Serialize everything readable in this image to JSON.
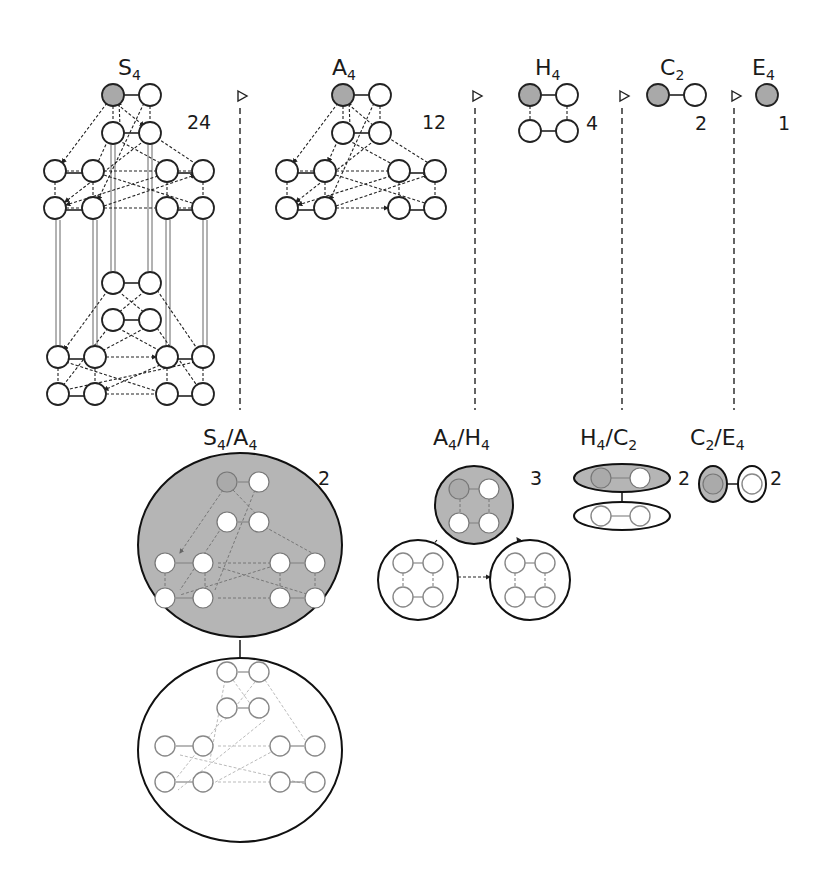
{
  "figure": {
    "type": "Cayley graphs of the composition series of S4 and their quotient groups",
    "top_row": [
      {
        "id": "S4",
        "label_base": "S",
        "label_sub": "4",
        "order": "24"
      },
      {
        "id": "A4",
        "label_base": "A",
        "label_sub": "4",
        "order": "12"
      },
      {
        "id": "H4",
        "label_base": "H",
        "label_sub": "4",
        "order": "4"
      },
      {
        "id": "C2",
        "label_base": "C",
        "label_sub": "2",
        "order": "2"
      },
      {
        "id": "E4",
        "label_base": "E",
        "label_sub": "4",
        "order": "1"
      }
    ],
    "subgroup_marker": "normal-subgroup-triangle-icon",
    "quotients": [
      {
        "id": "S4/A4",
        "num_base": "S",
        "num_sub": "4",
        "den_base": "A",
        "den_sub": "4",
        "order": "2"
      },
      {
        "id": "A4/H4",
        "num_base": "A",
        "num_sub": "4",
        "den_base": "H",
        "den_sub": "4",
        "order": "3"
      },
      {
        "id": "H4/C2",
        "num_base": "H",
        "num_sub": "4",
        "den_base": "C",
        "den_sub": "2",
        "order": "2"
      },
      {
        "id": "C2/E4",
        "num_base": "C",
        "num_sub": "2",
        "den_base": "E",
        "den_sub": "4",
        "order": "2"
      }
    ],
    "slash": "/",
    "colors": {
      "identity_node": "#a9a9a9",
      "shaded_coset": "#b5b5b5",
      "outline": "#222222",
      "faded": "#888888"
    }
  }
}
